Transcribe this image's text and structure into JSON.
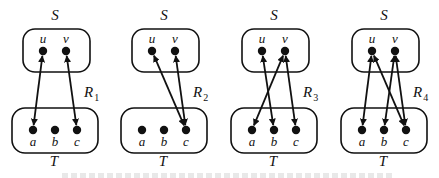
{
  "diagram": {
    "source_set": {
      "name": "S",
      "elements": [
        "u",
        "v"
      ]
    },
    "target_set": {
      "name": "T",
      "elements": [
        "a",
        "b",
        "c"
      ]
    },
    "panels": [
      {
        "relation": "R",
        "subscript": "1",
        "ox": 0,
        "pairs": [
          [
            "u",
            "a"
          ],
          [
            "v",
            "c"
          ]
        ]
      },
      {
        "relation": "R",
        "subscript": "2",
        "ox": 109,
        "pairs": [
          [
            "u",
            "c"
          ],
          [
            "v",
            "c"
          ]
        ]
      },
      {
        "relation": "R",
        "subscript": "3",
        "ox": 219,
        "pairs": [
          [
            "u",
            "b"
          ],
          [
            "v",
            "a"
          ],
          [
            "v",
            "c"
          ]
        ]
      },
      {
        "relation": "R",
        "subscript": "4",
        "ox": 329,
        "pairs": [
          [
            "u",
            "a"
          ],
          [
            "u",
            "c"
          ],
          [
            "v",
            "b"
          ],
          [
            "v",
            "c"
          ]
        ]
      }
    ],
    "caption_visible": "partially cut off at bottom edge (unreadable)"
  }
}
